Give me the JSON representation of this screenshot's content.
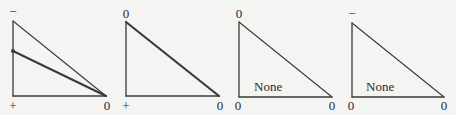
{
  "figure": {
    "width": 456,
    "height": 115,
    "background": "#f4f4f2",
    "line_color": "#3a3a3a"
  },
  "panels": [
    {
      "id": "panel-1",
      "vertices": {
        "top": [
          13,
          21
        ],
        "bottom_left": [
          13,
          96
        ],
        "right": [
          106,
          96
        ]
      },
      "labels": {
        "top": "−",
        "bottom_left": "+",
        "right": "0"
      },
      "label_positions": {
        "top": [
          13,
          16
        ],
        "bottom_left": [
          13,
          110
        ],
        "right": [
          107,
          110
        ]
      },
      "hypotenuse_bold": false,
      "extra_line": {
        "from": [
          13,
          51
        ],
        "to": [
          106,
          96
        ],
        "bold": true,
        "dot": true
      },
      "inner_text": null
    },
    {
      "id": "panel-2",
      "vertices": {
        "top": [
          126,
          22
        ],
        "bottom_left": [
          126,
          96
        ],
        "right": [
          219,
          96
        ]
      },
      "labels": {
        "top": "0",
        "bottom_left": "+",
        "right": "0"
      },
      "label_positions": {
        "top": [
          126,
          18
        ],
        "bottom_left": [
          126,
          110
        ],
        "right": [
          220,
          110
        ]
      },
      "hypotenuse_bold": true,
      "extra_line": null,
      "inner_text": null
    },
    {
      "id": "panel-3",
      "vertices": {
        "top": [
          239,
          22
        ],
        "bottom_left": [
          239,
          97
        ],
        "right": [
          332,
          97
        ]
      },
      "labels": {
        "top": "0",
        "bottom_left": "0",
        "right": "0"
      },
      "label_positions": {
        "top": [
          239,
          18
        ],
        "bottom_left": [
          238,
          110
        ],
        "right": [
          332,
          110
        ]
      },
      "hypotenuse_bold": false,
      "extra_line": null,
      "inner_text": {
        "text": "None",
        "x": 254,
        "y": 91
      }
    },
    {
      "id": "panel-4",
      "vertices": {
        "top": [
          352,
          23
        ],
        "bottom_left": [
          352,
          97
        ],
        "right": [
          444,
          97
        ]
      },
      "labels": {
        "top": "−",
        "bottom_left": "0",
        "right": "0"
      },
      "label_positions": {
        "top": [
          352,
          18
        ],
        "bottom_left": [
          351,
          110
        ],
        "right": [
          444,
          110
        ]
      },
      "hypotenuse_bold": false,
      "extra_line": null,
      "inner_text": {
        "text": "None",
        "x": 366,
        "y": 91
      }
    }
  ]
}
